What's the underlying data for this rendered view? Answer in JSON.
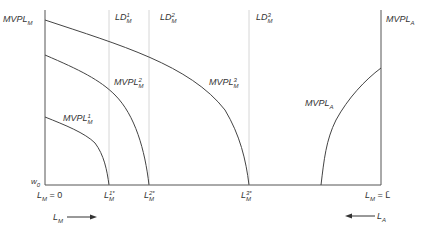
{
  "diagram": {
    "colors": {
      "axis": "#555555",
      "curve": "#444444",
      "dotted": "#bbbbbb",
      "text": "#333333"
    },
    "axes": {
      "left_label": {
        "base": "MVPL",
        "sub": "M"
      },
      "right_label": {
        "base": "MVPL",
        "sub": "A"
      },
      "wage_label": {
        "base": "w",
        "sub": "0"
      },
      "origin_left": {
        "base": "L",
        "sub": "M",
        "rest": " = 0"
      },
      "origin_right": {
        "base": "L",
        "sub": "M",
        "rest": " = L̄"
      }
    },
    "labor_demand_lines": [
      {
        "base": "LD",
        "sup": "1",
        "sub": "M"
      },
      {
        "base": "LD",
        "sup": "2",
        "sub": "M"
      },
      {
        "base": "LD",
        "sup": "3",
        "sub": "M"
      }
    ],
    "curves": [
      {
        "base": "MVPL",
        "sup": "1",
        "sub": "M"
      },
      {
        "base": "MVPL",
        "sup": "2",
        "sub": "M"
      },
      {
        "base": "MVPL",
        "sup": "3",
        "sub": "M"
      },
      {
        "base": "MVPL",
        "sup": "",
        "sub": "A"
      }
    ],
    "equilibria": [
      {
        "base": "L",
        "sup": "1*",
        "sub": "M"
      },
      {
        "base": "L",
        "sup": "2*",
        "sub": "M"
      },
      {
        "base": "L",
        "sup": "3*",
        "sub": "M"
      }
    ],
    "direction_arrows": [
      {
        "base": "L",
        "sub": "M",
        "direction": "right"
      },
      {
        "base": "L",
        "sub": "A",
        "direction": "left"
      }
    ]
  }
}
